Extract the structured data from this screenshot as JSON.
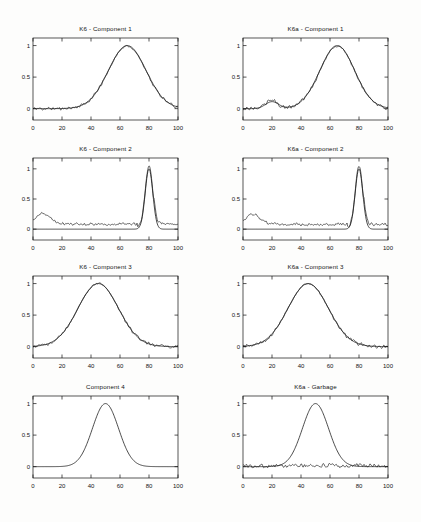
{
  "figure": {
    "width": 421,
    "height": 522,
    "background": "#fdfdfc",
    "line_color": "#101010"
  },
  "chart_data": [
    {
      "id": "k6-component-1",
      "type": "line",
      "title": "K6 - Component 1",
      "row": 1,
      "column": "left",
      "xlabel": "",
      "ylabel": "",
      "xlim": [
        0,
        100
      ],
      "ylim": [
        -0.18,
        1.12
      ],
      "xticks": [
        0,
        20,
        40,
        60,
        80,
        100
      ],
      "yticks": [
        0,
        0.5,
        1
      ],
      "xtick_labels": [
        "0",
        "20",
        "40",
        "60",
        "80",
        "100"
      ],
      "ytick_labels": [
        "0",
        "0.5",
        "1"
      ],
      "grid": false,
      "legend": "none",
      "series": [
        {
          "name": "smooth fit",
          "style": "smooth",
          "peaks": [
            {
              "center": 65,
              "height": 1.0,
              "width": 13
            }
          ],
          "baseline": 0.0
        },
        {
          "name": "measured signal",
          "style": "noisy",
          "peaks": [
            {
              "center": 65,
              "height": 0.99,
              "width": 13
            }
          ],
          "baseline": 0.0,
          "noise": 0.035,
          "noise_seed": 11
        }
      ]
    },
    {
      "id": "k6a-component-1",
      "type": "line",
      "title": "K6a - Component 1",
      "row": 1,
      "column": "right",
      "xlabel": "",
      "ylabel": "",
      "xlim": [
        0,
        100
      ],
      "ylim": [
        -0.18,
        1.12
      ],
      "xticks": [
        0,
        20,
        40,
        60,
        80,
        100
      ],
      "yticks": [
        0,
        0.5,
        1
      ],
      "xtick_labels": [
        "0",
        "20",
        "40",
        "60",
        "80",
        "100"
      ],
      "ytick_labels": [
        "0",
        "0.5",
        "1"
      ],
      "grid": false,
      "legend": "none",
      "series": [
        {
          "name": "smooth fit",
          "style": "smooth",
          "peaks": [
            {
              "center": 20,
              "height": 0.11,
              "width": 4.5
            },
            {
              "center": 65,
              "height": 1.0,
              "width": 12
            }
          ],
          "baseline": 0.0
        },
        {
          "name": "measured signal",
          "style": "noisy",
          "peaks": [
            {
              "center": 20,
              "height": 0.13,
              "width": 4
            },
            {
              "center": 65,
              "height": 0.99,
              "width": 12
            }
          ],
          "baseline": 0.0,
          "noise": 0.04,
          "noise_seed": 23
        }
      ]
    },
    {
      "id": "k6-component-2",
      "type": "line",
      "title": "K6 - Component 2",
      "row": 2,
      "column": "left",
      "xlabel": "",
      "ylabel": "",
      "xlim": [
        0,
        100
      ],
      "ylim": [
        -0.18,
        1.18
      ],
      "xticks": [
        0,
        20,
        40,
        60,
        80,
        100
      ],
      "yticks": [
        0,
        0.5,
        1
      ],
      "xtick_labels": [
        "0",
        "20",
        "40",
        "60",
        "80",
        "100"
      ],
      "ytick_labels": [
        "0",
        "0.5",
        "1"
      ],
      "grid": false,
      "legend": "none",
      "series": [
        {
          "name": "smooth fit",
          "style": "smooth",
          "peaks": [
            {
              "center": 80,
              "height": 1.0,
              "width": 2.6
            }
          ],
          "baseline": 0.0
        },
        {
          "name": "measured signal",
          "style": "noisy",
          "peaks": [
            {
              "center": 7,
              "height": 0.17,
              "width": 5
            },
            {
              "center": 80,
              "height": 1.05,
              "width": 2.6
            }
          ],
          "baseline": 0.085,
          "noise": 0.03,
          "noise_seed": 37,
          "flat_zone": [
            72,
            78
          ]
        }
      ]
    },
    {
      "id": "k6a-component-2",
      "type": "line",
      "title": "K6a - Component 2",
      "row": 2,
      "column": "right",
      "xlabel": "",
      "ylabel": "",
      "xlim": [
        0,
        100
      ],
      "ylim": [
        -0.18,
        1.18
      ],
      "xticks": [
        0,
        20,
        40,
        60,
        80,
        100
      ],
      "yticks": [
        0,
        0.5,
        1
      ],
      "xtick_labels": [
        "0",
        "20",
        "40",
        "60",
        "80",
        "100"
      ],
      "ytick_labels": [
        "0",
        "0.5",
        "1"
      ],
      "grid": false,
      "legend": "none",
      "series": [
        {
          "name": "smooth fit",
          "style": "smooth",
          "peaks": [
            {
              "center": 80,
              "height": 1.0,
              "width": 2.6
            }
          ],
          "baseline": 0.0
        },
        {
          "name": "measured signal",
          "style": "noisy",
          "peaks": [
            {
              "center": 7,
              "height": 0.16,
              "width": 5
            },
            {
              "center": 80,
              "height": 1.05,
              "width": 2.6
            }
          ],
          "baseline": 0.08,
          "noise": 0.032,
          "noise_seed": 53,
          "flat_zone": [
            72,
            78
          ]
        }
      ]
    },
    {
      "id": "k6-component-3",
      "type": "line",
      "title": "K6 - Component 3",
      "row": 3,
      "column": "left",
      "xlabel": "",
      "ylabel": "",
      "xlim": [
        0,
        100
      ],
      "ylim": [
        -0.18,
        1.12
      ],
      "xticks": [
        0,
        20,
        40,
        60,
        80,
        100
      ],
      "yticks": [
        0,
        0.5,
        1
      ],
      "xtick_labels": [
        "0",
        "20",
        "40",
        "60",
        "80",
        "100"
      ],
      "ytick_labels": [
        "0",
        "0.5",
        "1"
      ],
      "grid": false,
      "legend": "none",
      "series": [
        {
          "name": "smooth fit",
          "style": "smooth",
          "peaks": [
            {
              "center": 45,
              "height": 1.0,
              "width": 14
            }
          ],
          "baseline": 0.0
        },
        {
          "name": "measured signal",
          "style": "noisy",
          "peaks": [
            {
              "center": 45,
              "height": 1.0,
              "width": 14
            }
          ],
          "baseline": 0.0,
          "noise": 0.035,
          "noise_seed": 71
        }
      ]
    },
    {
      "id": "k6a-component-3",
      "type": "line",
      "title": "K6a - Component 3",
      "row": 3,
      "column": "right",
      "xlabel": "",
      "ylabel": "",
      "xlim": [
        0,
        100
      ],
      "ylim": [
        -0.18,
        1.12
      ],
      "xticks": [
        0,
        20,
        40,
        60,
        80,
        100
      ],
      "yticks": [
        0,
        0.5,
        1
      ],
      "xtick_labels": [
        "0",
        "20",
        "40",
        "60",
        "80",
        "100"
      ],
      "ytick_labels": [
        "0",
        "0.5",
        "1"
      ],
      "grid": false,
      "legend": "none",
      "series": [
        {
          "name": "smooth fit",
          "style": "smooth",
          "peaks": [
            {
              "center": 45,
              "height": 1.0,
              "width": 14
            }
          ],
          "baseline": 0.0
        },
        {
          "name": "measured signal",
          "style": "noisy",
          "peaks": [
            {
              "center": 45,
              "height": 1.0,
              "width": 14
            }
          ],
          "baseline": 0.0,
          "noise": 0.04,
          "noise_seed": 89
        }
      ]
    },
    {
      "id": "component-4",
      "type": "line",
      "title": "Component 4",
      "row": 4,
      "column": "left",
      "xlabel": "",
      "ylabel": "",
      "xlim": [
        0,
        100
      ],
      "ylim": [
        -0.18,
        1.12
      ],
      "xticks": [
        0,
        20,
        40,
        60,
        80,
        100
      ],
      "yticks": [
        0,
        0.5,
        1
      ],
      "xtick_labels": [
        "0",
        "20",
        "40",
        "60",
        "80",
        "100"
      ],
      "ytick_labels": [
        "0",
        "0.5",
        "1"
      ],
      "grid": false,
      "legend": "none",
      "series": [
        {
          "name": "smooth fit",
          "style": "smooth",
          "peaks": [
            {
              "center": 50,
              "height": 1.0,
              "width": 9
            }
          ],
          "baseline": 0.0
        }
      ]
    },
    {
      "id": "k6a-garbage",
      "type": "line",
      "title": "K6a - Garbage",
      "row": 4,
      "column": "right",
      "xlabel": "",
      "ylabel": "",
      "xlim": [
        0,
        100
      ],
      "ylim": [
        -0.18,
        1.12
      ],
      "xticks": [
        0,
        20,
        40,
        60,
        80,
        100
      ],
      "yticks": [
        0,
        0.5,
        1
      ],
      "xtick_labels": [
        "0",
        "20",
        "40",
        "60",
        "80",
        "100"
      ],
      "ytick_labels": [
        "0",
        "0.5",
        "1"
      ],
      "grid": false,
      "legend": "none",
      "series": [
        {
          "name": "smooth fit",
          "style": "smooth",
          "peaks": [
            {
              "center": 50,
              "height": 1.0,
              "width": 9
            }
          ],
          "baseline": 0.0
        },
        {
          "name": "residual noise",
          "style": "noisy",
          "peaks": [],
          "baseline": 0.015,
          "noise": 0.045,
          "noise_seed": 101
        }
      ]
    }
  ]
}
